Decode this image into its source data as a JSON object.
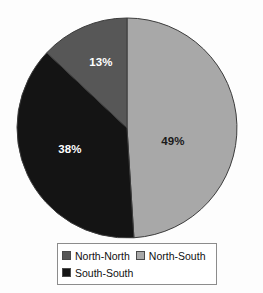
{
  "chart_data": {
    "type": "pie",
    "title": "",
    "categories": [
      "North-North",
      "North-South",
      "South-South"
    ],
    "values": [
      13,
      49,
      38
    ],
    "value_labels": [
      "13%",
      "49%",
      "38%"
    ],
    "colors": [
      "#575757",
      "#a8a8a8",
      "#141414"
    ],
    "label_text_colors": [
      "#ffffff",
      "#1a1a1a",
      "#ffffff"
    ],
    "legend_position": "bottom",
    "grid": false,
    "units": "percent",
    "start_angle_deg": 0,
    "direction": "clockwise"
  },
  "pie": {
    "center_x": 127,
    "center_y": 128,
    "radius": 110,
    "outline_color": "#3c3c3c",
    "slices": [
      {
        "name": "North-South",
        "label": "49%",
        "percent": 49,
        "fill": "#a8a8a8",
        "label_x": 173,
        "label_y": 145,
        "label_color": "#1a1a1a"
      },
      {
        "name": "South-South",
        "label": "38%",
        "percent": 38,
        "fill": "#141414",
        "label_x": 70,
        "label_y": 153,
        "label_color": "#ffffff"
      },
      {
        "name": "North-North",
        "label": "13%",
        "percent": 13,
        "fill": "#575757",
        "label_x": 101,
        "label_y": 66,
        "label_color": "#ffffff"
      }
    ]
  },
  "legend": {
    "rows": [
      [
        {
          "label": "North-North",
          "color": "#575757"
        },
        {
          "label": "North-South",
          "color": "#a8a8a8"
        }
      ],
      [
        {
          "label": "South-South",
          "color": "#141414"
        }
      ]
    ]
  }
}
